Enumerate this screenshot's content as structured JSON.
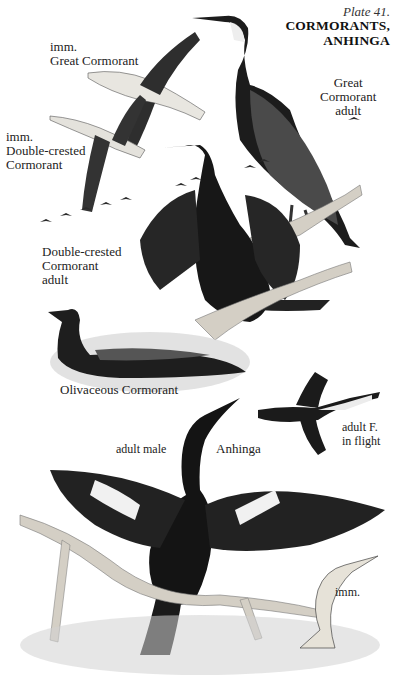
{
  "plate": {
    "number": "Plate 41.",
    "title_line1": "CORMORANTS,",
    "title_line2": "ANHINGA"
  },
  "labels": {
    "great_cormorant_adult": {
      "line1": "Great",
      "line2": "Cormorant",
      "line3": "adult"
    },
    "imm_great_cormorant": {
      "line1": "imm.",
      "line2": "Great Cormorant"
    },
    "imm_double_crested": {
      "line1": "imm.",
      "line2": "Double-crested",
      "line3": "Cormorant"
    },
    "double_crested_adult": {
      "line1": "Double-crested",
      "line2": "Cormorant",
      "line3": "adult"
    },
    "olivaceous": {
      "line1": "Olivaceous Cormorant"
    },
    "anhinga_female_flight": {
      "line1": "adult F.",
      "line2": "in flight"
    },
    "anhinga_adult_male": {
      "line1": "adult male"
    },
    "anhinga_species": {
      "line1": "Anhinga"
    },
    "anhinga_imm": {
      "line1": "imm."
    }
  },
  "colors": {
    "ink_dark": "#141414",
    "ink_mid": "#3a3a3a",
    "pale_plumage": "#e6e3dc",
    "branch": "#d9d4ca",
    "water": "#cfcfcf",
    "paper": "#ffffff"
  }
}
